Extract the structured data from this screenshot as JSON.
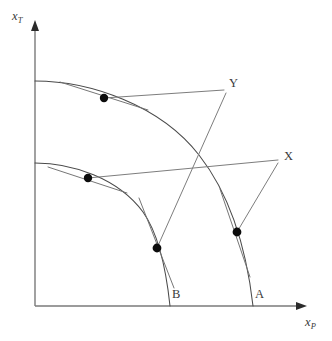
{
  "figure": {
    "kind": "production-possibility-frontier",
    "background_color": "#ffffff",
    "line_color": "#4a4a4a",
    "axis_color": "#7a7a7a",
    "point_color": "#0c0c0c",
    "label_color": "#3a3a3a",
    "width": 332,
    "height": 341
  },
  "axes": {
    "y_axis": {
      "label_base": "x",
      "label_sub": "T",
      "label_x": 12,
      "label_y": 10,
      "x": 35,
      "y_top": 22,
      "y_bottom": 306
    },
    "x_axis": {
      "label_base": "x",
      "label_sub": "P",
      "label_x": 305,
      "label_y": 316,
      "y": 306,
      "x_left": 35,
      "x_right": 307
    }
  },
  "curves": [
    {
      "name": "inner-ppf-curve",
      "label": "B",
      "y_intercept": 163,
      "x_intercept": 170,
      "path": "M 35 163 C 72 163 118 178 143 212 C 158 233 166 268 170 306"
    },
    {
      "name": "outer-ppf-curve",
      "label": "A",
      "y_intercept": 81,
      "x_intercept": 253,
      "path": "M 35 81 C 90 81 160 105 199 155 C 228 192 246 245 253 306"
    }
  ],
  "price_lines": [
    {
      "name": "price-line-x",
      "label": "X",
      "label_x": 284,
      "label_y": 150,
      "path": "M 88 178 L 278 160",
      "segments": [
        "M 88 178 L 278 160",
        "M 237 232 L 278 163"
      ]
    },
    {
      "name": "price-line-y",
      "label": "Y",
      "label_x": 229,
      "label_y": 77,
      "path": "M 104 98 L 224 90",
      "segments": [
        "M 104 98 L 224 90",
        "M 157 248 L 226 93"
      ]
    }
  ],
  "tangents": [
    {
      "name": "tangent-outer-upper",
      "path": "M 60 82 L 148 110"
    },
    {
      "name": "tangent-inner-upper",
      "path": "M 48 167 L 127 193"
    },
    {
      "name": "tangent-inner-lower",
      "path": "M 139 198 L 174 288"
    },
    {
      "name": "tangent-outer-lower",
      "path": "M 220 189 L 250 277"
    }
  ],
  "points": [
    {
      "name": "point-outer-upper",
      "x": 104,
      "y": 98,
      "r": 4.2,
      "label": ""
    },
    {
      "name": "point-inner-upper",
      "x": 88,
      "y": 178,
      "r": 4.2,
      "label": ""
    },
    {
      "name": "point-b",
      "x": 157,
      "y": 248,
      "r": 4.4,
      "label": "B",
      "label_x": 172,
      "label_y": 288
    },
    {
      "name": "point-a",
      "x": 237,
      "y": 232,
      "r": 4.4,
      "label": "A",
      "label_x": 255,
      "label_y": 288
    }
  ],
  "labels": {
    "curve_b": "B",
    "curve_a": "A",
    "line_x": "X",
    "line_y": "Y"
  }
}
